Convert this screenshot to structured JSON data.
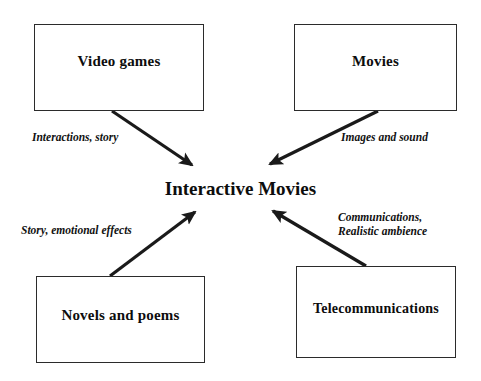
{
  "diagram": {
    "title_node": "Interactive Movies",
    "nodes": [
      {
        "id": "video-games",
        "label": "Video games"
      },
      {
        "id": "movies",
        "label": "Movies"
      },
      {
        "id": "novels",
        "label": "Novels and poems"
      },
      {
        "id": "telecommunications",
        "label": "Telecommunications"
      }
    ],
    "edges": [
      {
        "id": "video-games-edge",
        "from": "video-games",
        "to": "interactive-movies",
        "label": "Interactions, story"
      },
      {
        "id": "movies-edge",
        "from": "movies",
        "to": "interactive-movies",
        "label": "Images and sound"
      },
      {
        "id": "novels-edge",
        "from": "novels",
        "to": "interactive-movies",
        "label": "Story, emotional effects"
      },
      {
        "id": "telecom-edge-line1",
        "from": "telecommunications",
        "to": "interactive-movies",
        "label": "Communications,"
      },
      {
        "id": "telecom-edge-line2",
        "from": "telecommunications",
        "to": "interactive-movies",
        "label": "Realistic ambience"
      }
    ],
    "colors": {
      "stroke": "#1a1a1a",
      "box_border": "#2b2b2b",
      "text": "#0d0d0d",
      "background": "#ffffff"
    }
  }
}
